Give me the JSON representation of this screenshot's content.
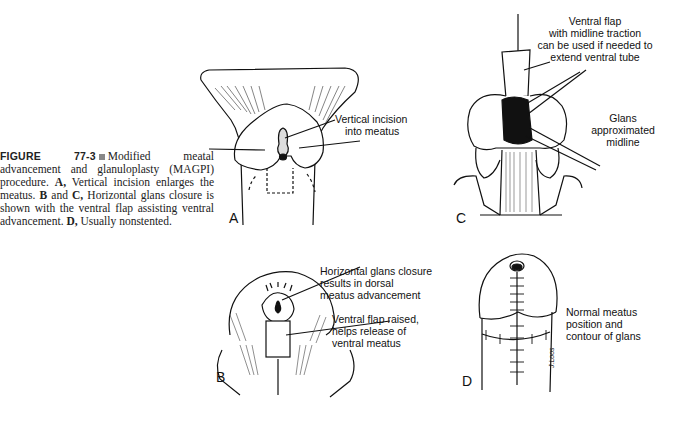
{
  "figure": {
    "number_label": "FIGURE 77-3",
    "caption_parts": [
      {
        "text": "Modified meatal advancement and glanuloplasty (MAGPI) procedure. ",
        "bold": false
      },
      {
        "text": "A,",
        "bold": true
      },
      {
        "text": " Vertical incision enlarges the meatus. ",
        "bold": false
      },
      {
        "text": "B",
        "bold": true
      },
      {
        "text": " and ",
        "bold": false
      },
      {
        "text": "C,",
        "bold": true
      },
      {
        "text": " Horizontal glans closure is shown with the ventral flap assisting ventral advancement. ",
        "bold": false
      },
      {
        "text": "D,",
        "bold": true
      },
      {
        "text": " Usually nonstented.",
        "bold": false
      }
    ]
  },
  "panels": {
    "A": {
      "letter": "A",
      "labels": [
        "Vertical incision",
        "into meatus"
      ]
    },
    "B": {
      "letter": "B",
      "labels_top": [
        "Horizontal glans closure",
        "results in dorsal",
        "meatus advancement"
      ],
      "labels_bottom": [
        "Ventral flap raised,",
        "helps release of",
        "ventral meatus"
      ]
    },
    "C": {
      "letter": "C",
      "labels_top": [
        "Ventral flap",
        "with midline traction",
        "can be used if needed to",
        "extend ventral tube"
      ],
      "labels_mid": [
        "Glans",
        "approximated",
        "midline"
      ]
    },
    "D": {
      "letter": "D",
      "labels": [
        "Normal meatus",
        "position and",
        "contour of glans"
      ],
      "signature": "J.Loos"
    }
  }
}
